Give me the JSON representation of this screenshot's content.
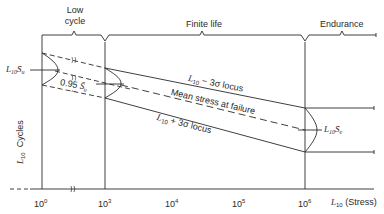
{
  "regions": {
    "low_cycle": [
      "Low",
      "cycle"
    ],
    "finite_life": "Finite life",
    "endurance": "Endurance"
  },
  "curves": {
    "upper_locus": {
      "prefix": "L",
      "sub": "10",
      "text": " − 3σ locus"
    },
    "mean": "Mean stress at failure",
    "lower_locus": {
      "prefix": "L",
      "sub": "10",
      "text": " + 3σ locus"
    }
  },
  "annotations": {
    "ultimate": {
      "prefix": "L",
      "sub": "10",
      "sym": "S̄",
      "symsub": "u"
    },
    "ninety_five": {
      "value": "0.95",
      "sym": "S̄",
      "symsub": "u"
    },
    "endurance_limit": {
      "prefix": "L",
      "sub": "10",
      "sym": "S̄",
      "symsub": "e"
    }
  },
  "axes": {
    "ylabel": {
      "prefix": "L",
      "sub": "10",
      "text": "Cycles"
    },
    "xlabel": {
      "prefix": "L",
      "sub": "10",
      "text": "(Stress)"
    },
    "xticks": [
      {
        "base": "10",
        "exp": "0"
      },
      {
        "base": "10",
        "exp": "3"
      },
      {
        "base": "10",
        "exp": "4"
      },
      {
        "base": "10",
        "exp": "5"
      },
      {
        "base": "10",
        "exp": "6"
      }
    ]
  }
}
